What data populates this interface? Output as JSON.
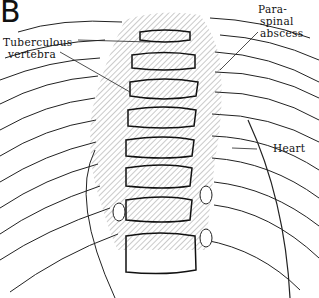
{
  "figure": {
    "panel_letter": "B",
    "labels": {
      "tuberculous_line1": "Tuberculous",
      "tuberculous_line2": "vertebra",
      "paraspinal_line1": "Para-",
      "paraspinal_line2": "spinal",
      "paraspinal_line3": "abscess",
      "heart": "Heart"
    }
  }
}
